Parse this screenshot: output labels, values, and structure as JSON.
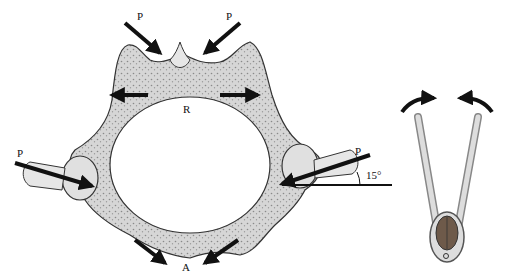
{
  "figure": {
    "labels": {
      "p_top_left": "P",
      "p_top_right": "P",
      "p_left": "P",
      "p_right": "P",
      "r": "R",
      "a": "A",
      "angle": "15°"
    },
    "colors": {
      "bone": "#d9d9d9",
      "bone_dark": "#9a9a9a",
      "outline": "#333333",
      "arrow": "#111111",
      "nut": "#6e5a4a"
    }
  }
}
